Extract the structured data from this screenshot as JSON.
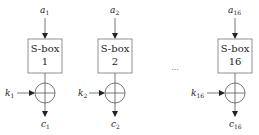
{
  "diagram": {
    "colors": {
      "stroke": "#555555",
      "text": "#222222",
      "background": "#ffffff"
    },
    "units": [
      {
        "input": "a",
        "input_sub": "1",
        "box_line1": "S-box",
        "box_line2": "1",
        "key": "k",
        "key_sub": "1",
        "output": "c",
        "output_sub": "1"
      },
      {
        "input": "a",
        "input_sub": "2",
        "box_line1": "S-box",
        "box_line2": "2",
        "key": "k",
        "key_sub": "2",
        "output": "c",
        "output_sub": "2"
      },
      {
        "input": "a",
        "input_sub": "16",
        "box_line1": "S-box",
        "box_line2": "16",
        "key": "k",
        "key_sub": "16",
        "output": "c",
        "output_sub": "16"
      }
    ],
    "ellipsis": "···"
  }
}
